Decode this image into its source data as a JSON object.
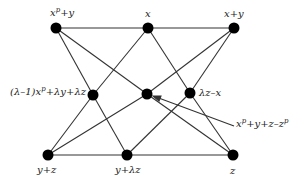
{
  "diagram": {
    "nodes": [
      {
        "id": "A",
        "label": "x^p+y",
        "x": 56,
        "y": 28
      },
      {
        "id": "B",
        "label": "x",
        "x": 148,
        "y": 28
      },
      {
        "id": "C",
        "label": "x+y",
        "x": 234,
        "y": 28
      },
      {
        "id": "D",
        "label": "(λ−1)x^p+λy+λz",
        "x": 93,
        "y": 95
      },
      {
        "id": "E",
        "label": "x^p+y+z−z^p",
        "x": 147,
        "y": 94
      },
      {
        "id": "F",
        "label": "λz−x",
        "x": 190,
        "y": 93
      },
      {
        "id": "G",
        "label": "y+z",
        "x": 48,
        "y": 155
      },
      {
        "id": "H",
        "label": "y+λz",
        "x": 127,
        "y": 155
      },
      {
        "id": "I",
        "label": "z",
        "x": 233,
        "y": 155
      }
    ],
    "edges": [
      [
        "A",
        "B"
      ],
      [
        "B",
        "C"
      ],
      [
        "A",
        "D"
      ],
      [
        "A",
        "E"
      ],
      [
        "B",
        "D"
      ],
      [
        "B",
        "F"
      ],
      [
        "C",
        "E"
      ],
      [
        "C",
        "F"
      ],
      [
        "D",
        "G"
      ],
      [
        "D",
        "H"
      ],
      [
        "E",
        "G"
      ],
      [
        "E",
        "I"
      ],
      [
        "F",
        "H"
      ],
      [
        "F",
        "I"
      ],
      [
        "G",
        "H"
      ],
      [
        "H",
        "I"
      ]
    ],
    "labels": {
      "A": "x",
      "A_sup": "p",
      "A_tail": "+y",
      "B": "x",
      "C": "x+y",
      "D_head": "(λ–1)x",
      "D_sup": "p",
      "D_tail": "+λy+λz",
      "F": "λz–x",
      "E_head": "x",
      "E_sup": "p",
      "E_mid": "+y+z–z",
      "E_sup2": "p",
      "G": "y+z",
      "H": "y+λz",
      "I": "z"
    }
  }
}
